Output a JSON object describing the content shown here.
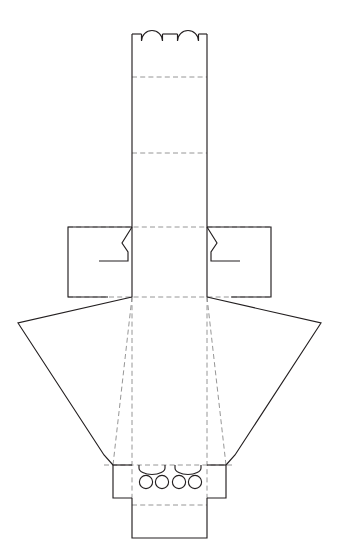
{
  "document": {
    "title": "Packaging Dieline Template",
    "kind": "die-cut-flat-layout",
    "units": "px",
    "width": 338,
    "height": 550,
    "background_color": "#ffffff"
  },
  "style": {
    "cut_color": "#231f20",
    "fold_color": "#8a8a8a",
    "panel_color": "#ffffff",
    "cut_width": 1.15,
    "fold_width": 0.9,
    "fold_dash": "5 3.2"
  },
  "geometry": {
    "center_x": 169.5,
    "column": {
      "left_x": 132,
      "right_x": 207,
      "top_y": 34,
      "bottom_y": 465
    },
    "fold_lines_horizontal": [
      77,
      153,
      227,
      297,
      465,
      505
    ],
    "fold_lines_vertical": [
      132,
      207
    ],
    "wing_fold_y": 297,
    "base_band_y": 465,
    "bottom_panel_bottom_y": 538
  },
  "parts": {
    "top_tabs": {
      "name": "top-locking-tabs",
      "count": 2,
      "shape": "arch",
      "width": 21,
      "height": 14,
      "baseline_y": 34,
      "centers_x": [
        152,
        188
      ]
    },
    "top_panel": {
      "name": "top-closure-panel",
      "top_y": 34,
      "bottom_y": 77
    },
    "upper_panel": {
      "name": "upper-face-panel",
      "top_y": 77,
      "bottom_y": 153
    },
    "mid_panel": {
      "name": "middle-face-panel",
      "top_y": 153,
      "bottom_y": 227
    },
    "lower_panel": {
      "name": "lower-face-panel",
      "top_y": 227,
      "bottom_y": 297
    },
    "left_side_flap": {
      "name": "left-side-glue-flap",
      "outer_x": 68,
      "inner_x": 132,
      "top_y": 227,
      "bottom_y": 297,
      "notch_depth": 24,
      "notch_y": 261
    },
    "right_side_flap": {
      "name": "right-side-glue-flap",
      "outer_x": 271,
      "inner_x": 207,
      "top_y": 227,
      "bottom_y": 297,
      "notch_depth": 24,
      "notch_y": 261
    },
    "left_wing": {
      "name": "left-angled-wing-panel",
      "hinge_top": [
        132,
        297
      ],
      "outer_top": [
        18,
        323
      ],
      "outer_bottom": [
        104,
        455
      ],
      "hinge_bottom": [
        113,
        465
      ],
      "fold_diagonal": [
        [
          132,
          297
        ],
        [
          113,
          465
        ]
      ]
    },
    "right_wing": {
      "name": "right-angled-wing-panel",
      "hinge_top": [
        207,
        297
      ],
      "outer_top": [
        321,
        323
      ],
      "outer_bottom": [
        235,
        455
      ],
      "hinge_bottom": [
        226,
        465
      ],
      "fold_diagonal": [
        [
          207,
          297
        ],
        [
          226,
          465
        ]
      ]
    },
    "base_band": {
      "name": "base-locking-band",
      "left_x": 113,
      "right_x": 226,
      "top_y": 465,
      "bottom_y": 498
    },
    "bottom_panel": {
      "name": "bottom-tuck-panel",
      "left_x": 132,
      "right_x": 207,
      "top_y": 498,
      "bottom_y": 538
    },
    "slots": {
      "name": "locking-slots",
      "count": 2,
      "shape": "arch-down",
      "width": 26,
      "depth": 7,
      "baseline_y": 465,
      "centers_x": [
        152,
        188
      ]
    },
    "holes": {
      "name": "ventilation-holes",
      "count": 4,
      "shape": "circle",
      "radius": 6.6,
      "center_y": 482,
      "centers_x": [
        146,
        162,
        179,
        195
      ]
    }
  },
  "legend": {
    "cut_label": "cut line",
    "fold_label": "fold line",
    "hole_label": "die-cut hole"
  }
}
